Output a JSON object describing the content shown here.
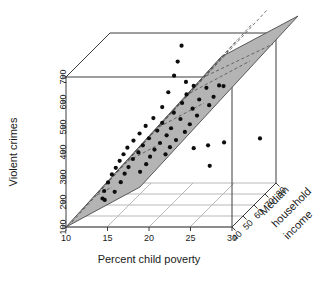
{
  "chart_data": {
    "type": "scatter",
    "subtype": "3d-scatter-with-regression-plane",
    "title": "",
    "xlabel": "Percent child poverty",
    "ylabel": "Violent crimes",
    "zlabel": "Median household income",
    "xlim": [
      10,
      30
    ],
    "ylim": [
      100,
      700
    ],
    "zlim": [
      40,
      80
    ],
    "xticks": [
      10,
      15,
      20,
      25,
      30
    ],
    "yticks": [
      100,
      200,
      300,
      400,
      500,
      600,
      700
    ],
    "zticks": [
      40,
      50,
      60,
      70,
      80
    ],
    "xtick_labels": [
      "10",
      "15",
      "20",
      "25",
      "30"
    ],
    "ytick_labels": [
      "100",
      "200",
      "300",
      "400",
      "500",
      "600",
      "700"
    ],
    "ztick_labels": [
      "40",
      "50",
      "60",
      "70",
      "80"
    ],
    "grid": true,
    "legend": false,
    "point_color": "#0d0d0d",
    "plane_color": "#b4b4b4",
    "plane_line_color": "#4f4f4f",
    "frame_color": "#3c3c3c",
    "floor_grid_color": "#b9b9b9",
    "surface": {
      "kind": "regression-plane",
      "note": "shaded plane with dashed mesh lines spanning the x-z domain"
    },
    "points": [
      {
        "x": 21.8,
        "y": 755,
        "z": 56.0
      },
      {
        "x": 21.6,
        "y": 700,
        "z": 54.0
      },
      {
        "x": 21.3,
        "y": 648,
        "z": 53.0
      },
      {
        "x": 22.4,
        "y": 612,
        "z": 55.5
      },
      {
        "x": 21.0,
        "y": 595,
        "z": 50.0
      },
      {
        "x": 23.0,
        "y": 585,
        "z": 58.0
      },
      {
        "x": 24.0,
        "y": 560,
        "z": 62.0
      },
      {
        "x": 25.0,
        "y": 552,
        "z": 66.0
      },
      {
        "x": 20.4,
        "y": 540,
        "z": 49.0
      },
      {
        "x": 22.0,
        "y": 530,
        "z": 55.0
      },
      {
        "x": 23.4,
        "y": 522,
        "z": 60.0
      },
      {
        "x": 24.6,
        "y": 515,
        "z": 64.0
      },
      {
        "x": 19.6,
        "y": 505,
        "z": 47.0
      },
      {
        "x": 21.2,
        "y": 498,
        "z": 53.5
      },
      {
        "x": 22.8,
        "y": 492,
        "z": 58.5
      },
      {
        "x": 24.2,
        "y": 486,
        "z": 63.0
      },
      {
        "x": 18.8,
        "y": 478,
        "z": 46.0
      },
      {
        "x": 20.2,
        "y": 470,
        "z": 50.5
      },
      {
        "x": 21.8,
        "y": 466,
        "z": 55.0
      },
      {
        "x": 23.2,
        "y": 460,
        "z": 59.5
      },
      {
        "x": 18.2,
        "y": 452,
        "z": 45.0
      },
      {
        "x": 19.8,
        "y": 446,
        "z": 49.0
      },
      {
        "x": 21.0,
        "y": 440,
        "z": 52.5
      },
      {
        "x": 22.6,
        "y": 434,
        "z": 57.5
      },
      {
        "x": 17.6,
        "y": 428,
        "z": 44.0
      },
      {
        "x": 19.0,
        "y": 422,
        "z": 47.5
      },
      {
        "x": 20.6,
        "y": 416,
        "z": 51.5
      },
      {
        "x": 22.2,
        "y": 410,
        "z": 56.0
      },
      {
        "x": 17.0,
        "y": 404,
        "z": 43.0
      },
      {
        "x": 18.4,
        "y": 398,
        "z": 46.5
      },
      {
        "x": 20.0,
        "y": 392,
        "z": 50.0
      },
      {
        "x": 21.4,
        "y": 386,
        "z": 54.0
      },
      {
        "x": 16.6,
        "y": 380,
        "z": 42.5
      },
      {
        "x": 18.0,
        "y": 374,
        "z": 45.5
      },
      {
        "x": 19.4,
        "y": 368,
        "z": 49.5
      },
      {
        "x": 20.8,
        "y": 362,
        "z": 53.0
      },
      {
        "x": 16.2,
        "y": 356,
        "z": 42.0
      },
      {
        "x": 17.4,
        "y": 350,
        "z": 45.0
      },
      {
        "x": 19.0,
        "y": 344,
        "z": 48.5
      },
      {
        "x": 20.4,
        "y": 338,
        "z": 52.0
      },
      {
        "x": 15.8,
        "y": 330,
        "z": 41.5
      },
      {
        "x": 17.0,
        "y": 322,
        "z": 44.0
      },
      {
        "x": 18.6,
        "y": 316,
        "z": 48.0
      },
      {
        "x": 15.4,
        "y": 306,
        "z": 41.0
      },
      {
        "x": 16.6,
        "y": 298,
        "z": 43.5
      },
      {
        "x": 18.0,
        "y": 290,
        "z": 47.0
      },
      {
        "x": 15.0,
        "y": 276,
        "z": 40.5
      },
      {
        "x": 16.2,
        "y": 266,
        "z": 43.0
      },
      {
        "x": 14.6,
        "y": 244,
        "z": 40.0
      },
      {
        "x": 15.6,
        "y": 232,
        "z": 42.0
      },
      {
        "x": 14.4,
        "y": 214,
        "z": 40.0
      },
      {
        "x": 14.6,
        "y": 206,
        "z": 40.5
      },
      {
        "x": 23.0,
        "y": 336,
        "z": 58.0
      },
      {
        "x": 24.2,
        "y": 330,
        "z": 62.0
      },
      {
        "x": 25.6,
        "y": 324,
        "z": 66.0
      },
      {
        "x": 28.6,
        "y": 296,
        "z": 76.0
      },
      {
        "x": 24.4,
        "y": 248,
        "z": 62.0
      },
      {
        "x": 22.4,
        "y": 560,
        "z": 56.0
      },
      {
        "x": 25.4,
        "y": 545,
        "z": 67.0
      }
    ]
  }
}
